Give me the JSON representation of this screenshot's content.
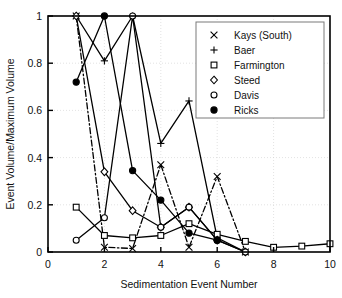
{
  "chart_data": {
    "type": "line",
    "title": "",
    "xlabel": "Sedimentation Event Number",
    "ylabel": "Event Volume/Maximum Volume",
    "xlim": [
      0,
      10
    ],
    "ylim": [
      0,
      1
    ],
    "xticks": [
      0,
      2,
      4,
      6,
      8,
      10
    ],
    "xtick_labels": [
      "0",
      "2",
      "4",
      "6",
      "8",
      "10"
    ],
    "yticks": [
      0,
      0.2,
      0.4,
      0.6,
      0.8,
      1
    ],
    "ytick_labels": [
      "0",
      "0.2",
      "0.4",
      "0.6",
      "0.8",
      "1"
    ],
    "grid": true,
    "legend_position": "top-right",
    "series": [
      {
        "name": "Kays (South)",
        "marker": "x-cross",
        "linestyle": "dashdot",
        "x": [
          1,
          2,
          3,
          4,
          5,
          6,
          7
        ],
        "values": [
          1.0,
          0.02,
          0.015,
          0.37,
          0.02,
          0.32,
          0.0
        ]
      },
      {
        "name": "Baer",
        "marker": "plus",
        "linestyle": "solid",
        "x": [
          1,
          2,
          3,
          4,
          5,
          6,
          7
        ],
        "values": [
          1.0,
          0.81,
          1.0,
          0.46,
          0.64,
          0.06,
          0.0
        ]
      },
      {
        "name": "Farmington",
        "marker": "square-open",
        "linestyle": "solid",
        "x": [
          1,
          2,
          3,
          4,
          5,
          6,
          7,
          8,
          9,
          10
        ],
        "values": [
          0.19,
          0.07,
          0.06,
          0.07,
          0.12,
          0.075,
          0.045,
          0.02,
          0.025,
          0.035
        ]
      },
      {
        "name": "Steed",
        "marker": "diamond-open",
        "linestyle": "solid",
        "x": [
          1,
          2,
          3,
          4,
          5,
          6,
          7
        ],
        "values": [
          1.0,
          0.34,
          0.175,
          0.105,
          0.19,
          0.05,
          0.0
        ]
      },
      {
        "name": "Davis",
        "marker": "circle-open",
        "linestyle": "solid",
        "x": [
          1,
          2,
          3,
          4,
          5,
          6,
          7
        ],
        "values": [
          0.05,
          0.145,
          1.0,
          0.105,
          0.19,
          0.05,
          0.0
        ]
      },
      {
        "name": "Ricks",
        "marker": "circle-filled",
        "linestyle": "solid",
        "x": [
          1,
          2,
          3,
          4,
          5,
          6
        ],
        "values": [
          0.72,
          1.0,
          0.345,
          0.22,
          0.08,
          0.05
        ]
      }
    ]
  }
}
